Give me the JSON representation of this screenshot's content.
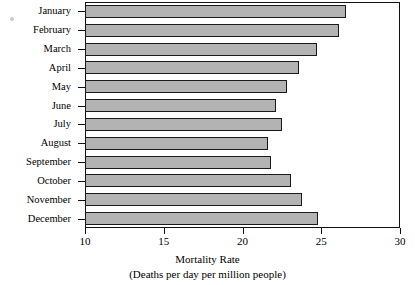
{
  "chart_data": {
    "type": "bar",
    "orientation": "horizontal",
    "title": "",
    "xlabel": "Mortality Rate",
    "xlabel_sub": "(Deaths per day per million people)",
    "ylabel": "",
    "xlim": [
      10,
      30
    ],
    "xticks": [
      10,
      15,
      20,
      25,
      30
    ],
    "xtick_labels": [
      "10",
      "15",
      "20",
      "25",
      "30"
    ],
    "grid": false,
    "legend": null,
    "categories": [
      "January",
      "February",
      "March",
      "April",
      "May",
      "June",
      "July",
      "August",
      "September",
      "October",
      "November",
      "December"
    ],
    "values": [
      26.6,
      26.1,
      24.7,
      23.6,
      22.8,
      22.1,
      22.5,
      21.6,
      21.8,
      23.1,
      23.8,
      24.8
    ],
    "bar_fill_color": "#b3b3b3",
    "bar_edge_color": "#1a1a1a",
    "frame_color": "#111111",
    "background_color": "#ffffff"
  }
}
